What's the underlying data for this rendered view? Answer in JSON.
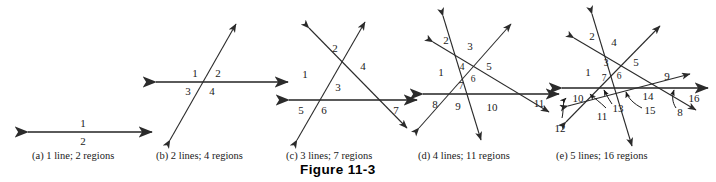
{
  "figure": {
    "caption": "Figure 11-3",
    "panels": [
      {
        "key": "a",
        "caption": "(a) 1 line; 2 regions",
        "lines": 1,
        "regions": 2,
        "region_labels": [
          "1",
          "2"
        ]
      },
      {
        "key": "b",
        "caption": "(b) 2 lines; 4 regions",
        "lines": 2,
        "regions": 4,
        "region_labels": [
          "1",
          "2",
          "3",
          "4"
        ]
      },
      {
        "key": "c",
        "caption": "(c) 3 lines; 7 regions",
        "lines": 3,
        "regions": 7,
        "region_labels": [
          "1",
          "2",
          "3",
          "4",
          "5",
          "6",
          "7"
        ]
      },
      {
        "key": "d",
        "caption": "(d) 4 lines; 11 regions",
        "lines": 4,
        "regions": 11,
        "region_labels": [
          "1",
          "2",
          "3",
          "4",
          "5",
          "6",
          "7",
          "8",
          "9",
          "10",
          "11"
        ]
      },
      {
        "key": "e",
        "caption": "(e) 5 lines; 16 regions",
        "lines": 5,
        "regions": 16,
        "region_labels": [
          "1",
          "2",
          "3",
          "4",
          "5",
          "6",
          "7",
          "8",
          "9",
          "10",
          "11",
          "12",
          "13",
          "14",
          "15",
          "16"
        ]
      }
    ]
  },
  "colors": {
    "background": "#ffffff",
    "line": "#2b2b2b",
    "line_highlight": "#5a5a5a",
    "text": "#1a1a1a"
  }
}
